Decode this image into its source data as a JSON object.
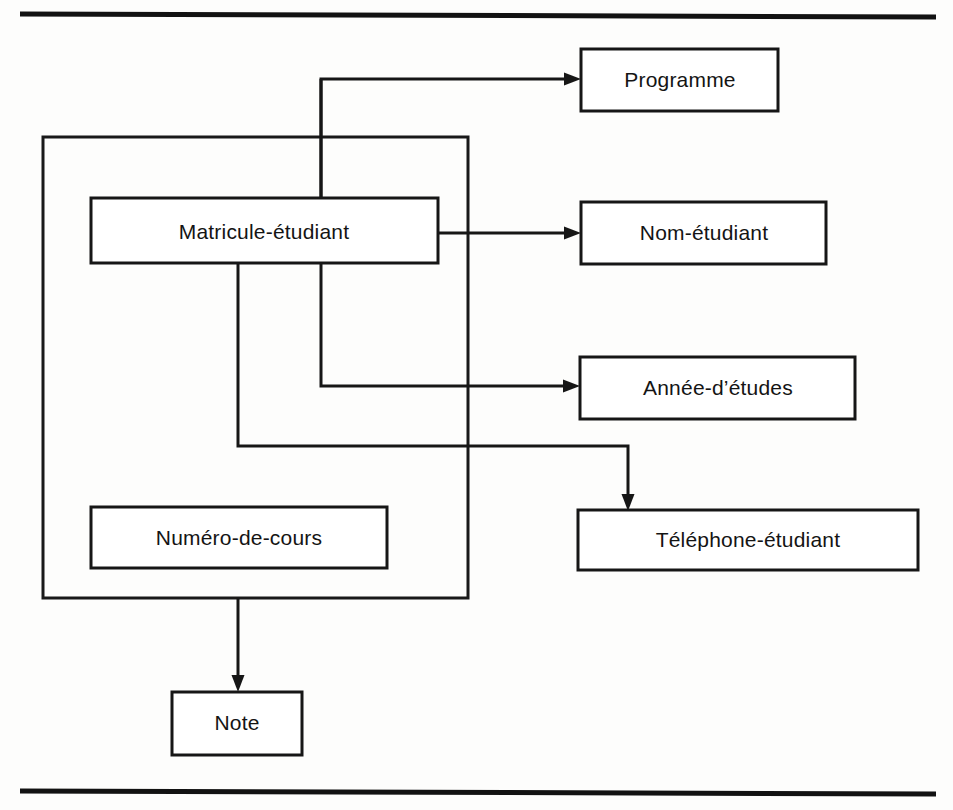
{
  "figure": {
    "kind": "entity-attribute-dependency-diagram",
    "language": "fr",
    "background_color": "#fdfdfc",
    "line_color": "#161616",
    "text_color": "#141414"
  },
  "rules": {
    "top_rule_label": "top-horizontal-rule",
    "bottom_rule_label": "bottom-horizontal-rule"
  },
  "grouping_frame": {
    "label": "grouping-frame",
    "encloses": [
      "Matricule-étudiant",
      "Numéro-de-cours"
    ]
  },
  "nodes": [
    {
      "id": "matricule",
      "label": "Matricule-étudiant"
    },
    {
      "id": "numero",
      "label": "Numéro-de-cours"
    },
    {
      "id": "programme",
      "label": "Programme"
    },
    {
      "id": "nom",
      "label": "Nom-étudiant"
    },
    {
      "id": "annee",
      "label": "Année-d’études"
    },
    {
      "id": "telephone",
      "label": "Téléphone-étudiant"
    },
    {
      "id": "note",
      "label": "Note"
    }
  ],
  "edges": [
    {
      "from": "matricule",
      "to": "programme"
    },
    {
      "from": "matricule",
      "to": "nom"
    },
    {
      "from": "matricule",
      "to": "annee"
    },
    {
      "from": "matricule",
      "to": "telephone"
    },
    {
      "from": "grouping-frame",
      "to": "note"
    }
  ]
}
